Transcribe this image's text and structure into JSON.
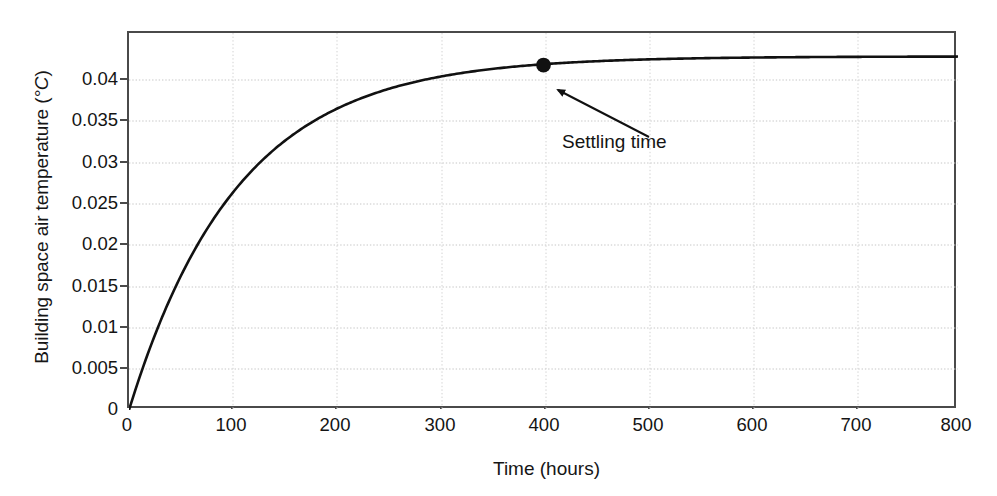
{
  "chart_data": {
    "type": "line",
    "title": "",
    "xlabel": "Time (hours)",
    "ylabel_text": "Building space air temperature (",
    "ylabel_unit": "°C",
    "ylabel_close": ")",
    "ylabel": "Building space air temperature (°C)",
    "xlim": [
      0,
      800
    ],
    "ylim": [
      0,
      0.0435
    ],
    "xticks": [
      0,
      100,
      200,
      300,
      400,
      500,
      600,
      700,
      800
    ],
    "xticklabels": [
      "0",
      "100",
      "200",
      "300",
      "400",
      "500",
      "600",
      "700",
      "800"
    ],
    "yticks": [
      0,
      0.005,
      0.01,
      0.015,
      0.02,
      0.025,
      0.03,
      0.035,
      0.04
    ],
    "yticklabels": [
      "0",
      "0.005",
      "0.01",
      "0.015",
      "0.02",
      "0.025",
      "0.03",
      "0.035",
      "0.04"
    ],
    "grid": "dotted horizontal and vertical gridlines at ticks",
    "legend": "none",
    "series": [
      {
        "name": "Building space air temperature step response",
        "curve_model": "first-order step response y = 0.0408*(1-exp(-t/105))",
        "steady_state_value": 0.0408,
        "time_constant_hours": 105,
        "x": [
          0,
          5,
          10,
          20,
          30,
          40,
          50,
          60,
          70,
          80,
          90,
          100,
          125,
          150,
          175,
          200,
          225,
          250,
          275,
          300,
          325,
          350,
          375,
          400,
          450,
          500,
          550,
          600,
          650,
          700,
          750,
          800
        ],
        "values": [
          0,
          0.0019,
          0.0037,
          0.0069,
          0.0097,
          0.0122,
          0.0144,
          0.0163,
          0.0181,
          0.0196,
          0.021,
          0.0222,
          0.0249,
          0.027,
          0.0287,
          0.0301,
          0.0313,
          0.0322,
          0.0329,
          0.0336,
          0.0341,
          0.0345,
          0.0348,
          0.0352,
          0.0362,
          0.037,
          0.0378,
          0.0385,
          0.039,
          0.0394,
          0.0398,
          0.0401
        ]
      }
    ],
    "annotations": [
      {
        "label": "Settling time",
        "marker_point": {
          "x": 400,
          "y": 0.0398
        },
        "marker_style": "filled-circle",
        "arrow": "from text up-left to marker"
      }
    ]
  },
  "colors": {
    "curve": "#111111",
    "axis": "#4a4a4a",
    "grid": "#c9c9c9",
    "text": "#141414",
    "background": "#ffffff"
  }
}
